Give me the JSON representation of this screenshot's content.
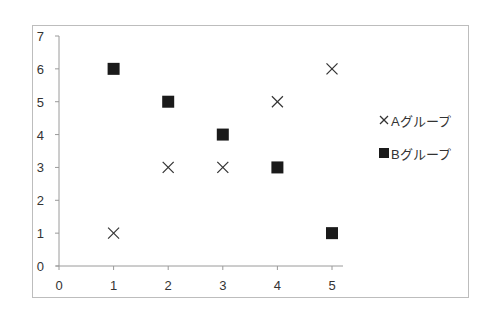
{
  "chart_data": {
    "type": "scatter",
    "title": "",
    "xlabel": "",
    "ylabel": "",
    "xlim": [
      0,
      5
    ],
    "ylim": [
      0,
      7
    ],
    "x_ticks": [
      "0",
      "1",
      "2",
      "3",
      "4",
      "5"
    ],
    "y_ticks": [
      "0",
      "1",
      "2",
      "3",
      "4",
      "5",
      "6",
      "7"
    ],
    "grid": false,
    "legend_position": "right",
    "series": [
      {
        "name": "Aグループ",
        "marker": "x",
        "color": "#333333",
        "points": [
          {
            "x": 1,
            "y": 1
          },
          {
            "x": 2,
            "y": 3
          },
          {
            "x": 3,
            "y": 3
          },
          {
            "x": 4,
            "y": 5
          },
          {
            "x": 5,
            "y": 6
          }
        ]
      },
      {
        "name": "Bグループ",
        "marker": "square",
        "color": "#1a1a1a",
        "points": [
          {
            "x": 1,
            "y": 6
          },
          {
            "x": 2,
            "y": 5
          },
          {
            "x": 3,
            "y": 4
          },
          {
            "x": 4,
            "y": 3
          },
          {
            "x": 5,
            "y": 1
          }
        ]
      }
    ]
  },
  "legend": {
    "items": [
      {
        "label": "Aグループ",
        "marker": "x-mark-icon"
      },
      {
        "label": "Bグループ",
        "marker": "square-icon"
      }
    ]
  },
  "colors": {
    "axis": "#9a9a9a",
    "frame": "#bdbdbd",
    "text": "#333333",
    "square_marker": "#1a1a1a",
    "x_marker": "#333333"
  }
}
